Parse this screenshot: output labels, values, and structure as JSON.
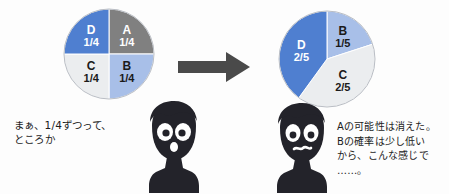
{
  "diagram": {
    "background_color": "#fdfdfd",
    "arrow": {
      "name": "transition-arrow",
      "direction": "right",
      "color": "#4a4a4a"
    },
    "palette": {
      "blue_medium": "#4f7fd0",
      "blue_light": "#a8bfe8",
      "gray_medium": "#808080",
      "gray_light": "#ebedef",
      "outline": "#b9bdc4",
      "ink": "#1c1c1c",
      "silhouette": "#23232a"
    }
  },
  "chart_data": [
    {
      "type": "pie",
      "name": "pie-before",
      "title": "",
      "center": [
        108,
        53
      ],
      "radius": 45,
      "start_angle_deg": 0,
      "direction": "clockwise",
      "categories": [
        "A",
        "B",
        "C",
        "D"
      ],
      "values": [
        0.25,
        0.25,
        0.25,
        0.25
      ],
      "slices": [
        {
          "letter": "A",
          "fraction_label": "1/4",
          "value": 0.25,
          "color": "#808080",
          "label_color": "light"
        },
        {
          "letter": "B",
          "fraction_label": "1/4",
          "value": 0.25,
          "color": "#a8bfe8",
          "label_color": "dark"
        },
        {
          "letter": "C",
          "fraction_label": "1/4",
          "value": 0.25,
          "color": "#ebedef",
          "label_color": "dark"
        },
        {
          "letter": "D",
          "fraction_label": "1/4",
          "value": 0.25,
          "color": "#4f7fd0",
          "label_color": "light"
        }
      ]
    },
    {
      "type": "pie",
      "name": "pie-after",
      "title": "",
      "center": [
        326,
        58
      ],
      "radius": 48,
      "start_angle_deg": 0,
      "direction": "clockwise",
      "categories": [
        "B",
        "C",
        "D"
      ],
      "values": [
        0.2,
        0.4,
        0.4
      ],
      "slices": [
        {
          "letter": "B",
          "fraction_label": "1/5",
          "value": 0.2,
          "color": "#a8bfe8",
          "label_color": "dark"
        },
        {
          "letter": "C",
          "fraction_label": "2/5",
          "value": 0.4,
          "color": "#ebedef",
          "label_color": "dark"
        },
        {
          "letter": "D",
          "fraction_label": "2/5",
          "value": 0.4,
          "color": "#4f7fd0",
          "label_color": "light"
        }
      ]
    }
  ],
  "characters": [
    {
      "name": "character-left",
      "expression": "surprised-open-mouth"
    },
    {
      "name": "character-right",
      "expression": "worried-wavy-mouth"
    }
  ],
  "speech": {
    "left": "まぁ、1/4ずつって、\nところか",
    "right": "Aの可能性は消えた。\nBの確率は少し低い\nから、こんな感じで\n……。"
  }
}
